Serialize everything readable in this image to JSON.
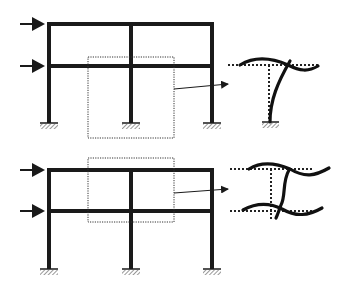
{
  "diagram": {
    "type": "structural-frame-deformation",
    "colors": {
      "ink": "#1a1a1a",
      "background": "#ffffff",
      "dotted": "#333333"
    },
    "frames": [
      {
        "id": "top-frame",
        "columns_x": [
          49,
          131,
          212
        ],
        "beams_y": [
          24,
          66
        ],
        "base_y": 122,
        "load_arrows": [
          {
            "y": 24
          },
          {
            "y": 66
          }
        ],
        "focus_box": {
          "x": 88,
          "y": 57,
          "w": 86,
          "h": 81
        },
        "detail": "beam-column joint at column with rotation"
      },
      {
        "id": "bottom-frame",
        "columns_x": [
          49,
          131,
          212
        ],
        "beams_y": [
          170,
          211
        ],
        "base_y": 268,
        "load_arrows": [
          {
            "y": 170
          },
          {
            "y": 211
          }
        ],
        "focus_box": {
          "x": 88,
          "y": 158,
          "w": 86,
          "h": 64
        },
        "detail": "column segment between two beams in double curvature"
      }
    ]
  }
}
